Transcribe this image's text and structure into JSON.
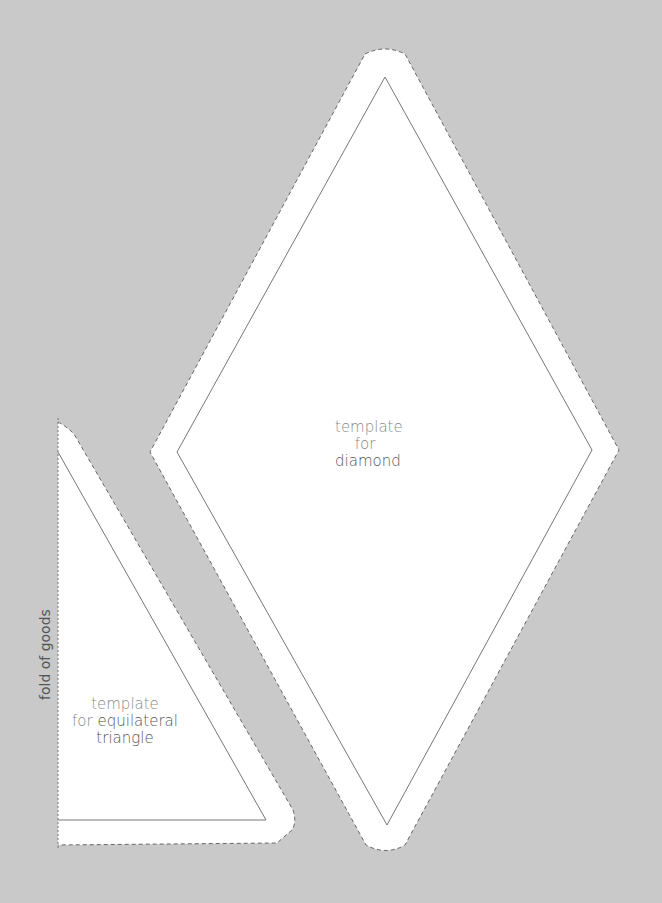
{
  "diamond": {
    "line1": "template",
    "line2": "for",
    "line3": "diamond"
  },
  "triangle": {
    "line1": "template",
    "line2a": "for",
    "line2b": "equilateral",
    "line3": "triangle"
  },
  "fold_label": "fold of goods",
  "colors": {
    "background": "#c9c9c9",
    "template_fill": "#ffffff",
    "cut_line": "#666666",
    "sew_line": "#777777"
  }
}
